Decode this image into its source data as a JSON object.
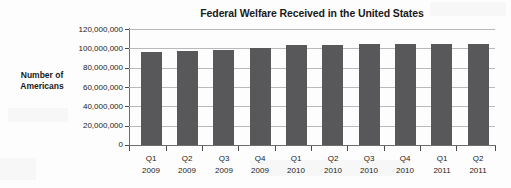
{
  "chart_data": {
    "type": "bar",
    "title": "Federal Welfare Received in the United States",
    "xlabel": "",
    "ylabel": "Number of Americans",
    "ylim": [
      0,
      120000000
    ],
    "grid": true,
    "legend": "none",
    "categories": [
      "Q1 2009",
      "Q2 2009",
      "Q3 2009",
      "Q4 2009",
      "Q1 2010",
      "Q2 2010",
      "Q3 2010",
      "Q4 2010",
      "Q1 2011",
      "Q2 2011"
    ],
    "category_lines": [
      {
        "quarter": "Q1",
        "year": "2009"
      },
      {
        "quarter": "Q2",
        "year": "2009"
      },
      {
        "quarter": "Q3",
        "year": "2009"
      },
      {
        "quarter": "Q4",
        "year": "2009"
      },
      {
        "quarter": "Q1",
        "year": "2010"
      },
      {
        "quarter": "Q2",
        "year": "2010"
      },
      {
        "quarter": "Q3",
        "year": "2010"
      },
      {
        "quarter": "Q4",
        "year": "2010"
      },
      {
        "quarter": "Q1",
        "year": "2011"
      },
      {
        "quarter": "Q2",
        "year": "2011"
      }
    ],
    "values": [
      96500000,
      97200000,
      98300000,
      100500000,
      103000000,
      103500000,
      104000000,
      104500000,
      105000000,
      105000000
    ],
    "y_ticks": [
      0,
      20000000,
      40000000,
      60000000,
      80000000,
      100000000,
      120000000
    ],
    "y_tick_labels": [
      "0",
      "20,000,000",
      "40,000,000",
      "60,000,000",
      "80,000,000",
      "100,000,000",
      "120,000,000"
    ],
    "bar_color": "#58585a",
    "grid_color": "#b9b9b9",
    "axis_color": "#6e6e6e",
    "text_color": "#1a1a1a",
    "background_color": "#fdfdfd"
  },
  "ylabel_lines": {
    "line1": "Number of",
    "line2": "Americans"
  }
}
